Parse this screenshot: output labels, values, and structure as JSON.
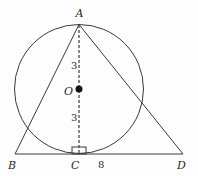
{
  "diagram": {
    "type": "geometry",
    "points": {
      "A": {
        "label": "A"
      },
      "O": {
        "label": "O"
      },
      "B": {
        "label": "B"
      },
      "C": {
        "label": "C"
      },
      "D": {
        "label": "D"
      }
    },
    "measurements": {
      "AO": "3",
      "OC": "3",
      "CD": "8"
    },
    "colors": {
      "stroke": "#3a3a3a",
      "text": "#2a2a2a",
      "background": "#fdfdfd"
    }
  }
}
